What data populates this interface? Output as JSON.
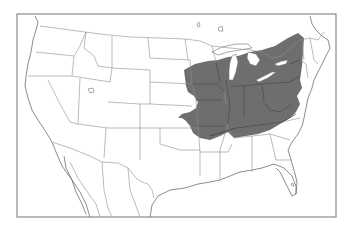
{
  "map": {
    "type": "range-map",
    "region": "North America (United States, southern Canada, northern Mexico)",
    "projection": "conic",
    "shaded_region": {
      "description": "Eastern-central United States range: Great Lakes states, Ohio Valley, Appalachians, into Missouri/eastern Kansas and northern Arkansas/Tennessee",
      "states_covered": [
        "Minnesota (southeast)",
        "Iowa",
        "Wisconsin (south)",
        "Michigan",
        "Illinois",
        "Indiana",
        "Ohio",
        "Kentucky",
        "Tennessee (north)",
        "Missouri",
        "Kansas (east)",
        "Arkansas (north)",
        "Pennsylvania",
        "New York",
        "West Virginia",
        "Virginia (west)",
        "Maryland (west)"
      ]
    },
    "colors": {
      "background": "#ffffff",
      "frame": "#8a8a8a",
      "borders": "#8f8f8f",
      "range_fill": "#6e6e6e",
      "range_borders": "#333333"
    },
    "frame": {
      "x": 17,
      "y": 14,
      "width": 319,
      "height": 203
    }
  }
}
